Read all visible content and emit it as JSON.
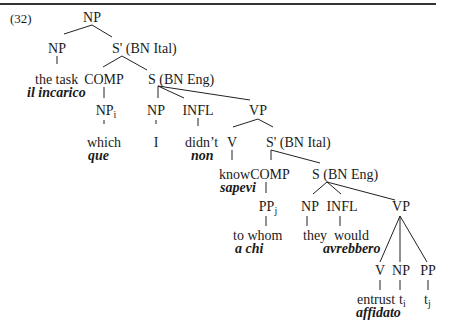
{
  "example_number": "(32)",
  "nodes": {
    "root_np": "NP",
    "np1": "NP",
    "sbar1": "S' (BN Ital)",
    "the_task": "the task",
    "il_incarico": "il incarico",
    "comp1": "COMP",
    "s1": "S (BN Eng)",
    "np_i": "NP",
    "np_i_sub": "i",
    "which": "which",
    "que": "que",
    "np2": "NP",
    "pron_I": "I",
    "infl1": "INFL",
    "didnt": "didn’t",
    "non": "non",
    "vp1": "VP",
    "v1": "V",
    "sbar2": "S' (BN Ital)",
    "know": "know",
    "sapevi": "sapevi",
    "comp2": "COMP",
    "s2": "S (BN Eng)",
    "pp_j": "PP",
    "pp_j_sub": "j",
    "to_whom": "to whom",
    "a_chi": "a chi",
    "np3": "NP",
    "they": "they",
    "infl2": "INFL",
    "would": "would",
    "avrebbero": "avrebbero",
    "vp2": "VP",
    "v2": "V",
    "np4": "NP",
    "pp2": "PP",
    "entrust": "entrust",
    "affidato": "affidato",
    "trace_i": "t",
    "trace_i_sub": "i",
    "trace_j": "t",
    "trace_j_sub": "j"
  }
}
